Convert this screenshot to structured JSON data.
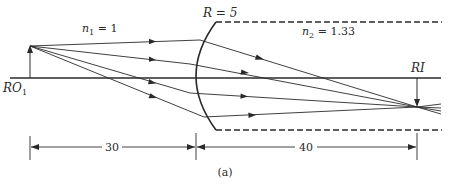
{
  "figure": {
    "caption": "(a)",
    "type": "refraction at spherical surface ray diagram"
  },
  "labels": {
    "n1": {
      "symbol": "n",
      "subscript": "1",
      "rest": " = 1"
    },
    "n2": {
      "symbol": "n",
      "subscript": "2",
      "rest": " = 1.33"
    },
    "radius": "R = 5",
    "object": {
      "main": "RO",
      "subscript": "1"
    },
    "image": "RI"
  },
  "dimensions": {
    "object_distance": "30",
    "image_distance": "40"
  },
  "colors": {
    "line": "#2a2a2a",
    "background": "#ffffff"
  }
}
